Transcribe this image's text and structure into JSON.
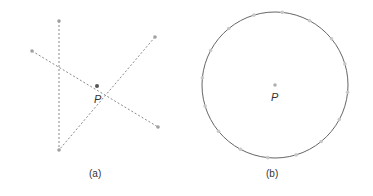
{
  "panel_a": {
    "caption": "(a)",
    "point_label": "P",
    "line_count": 3,
    "line_style": "dashed",
    "color": "#8a8a8a"
  },
  "panel_b": {
    "caption": "(b)",
    "point_label": "P",
    "shape": "circle",
    "circle_color": "#666666",
    "marker_count": 16,
    "marker_color": "#c8c8c8"
  }
}
